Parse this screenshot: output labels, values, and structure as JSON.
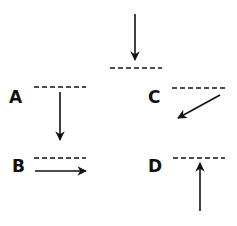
{
  "diagram": {
    "colors": {
      "stroke": "#111111",
      "background": "#ffffff"
    },
    "incident": {
      "description": "vertical downward arrow striking a dashed surface line",
      "direction": "down"
    },
    "options": [
      {
        "label": "A",
        "direction": "down",
        "description": "arrow continues straight down below the surface line"
      },
      {
        "label": "B",
        "direction": "right",
        "description": "arrow travels horizontally to the right just below the surface line"
      },
      {
        "label": "C",
        "direction": "down-left",
        "description": "arrow angled down and to the left below the surface line"
      },
      {
        "label": "D",
        "direction": "up",
        "description": "arrow pointing straight up toward the surface line from below"
      }
    ]
  }
}
